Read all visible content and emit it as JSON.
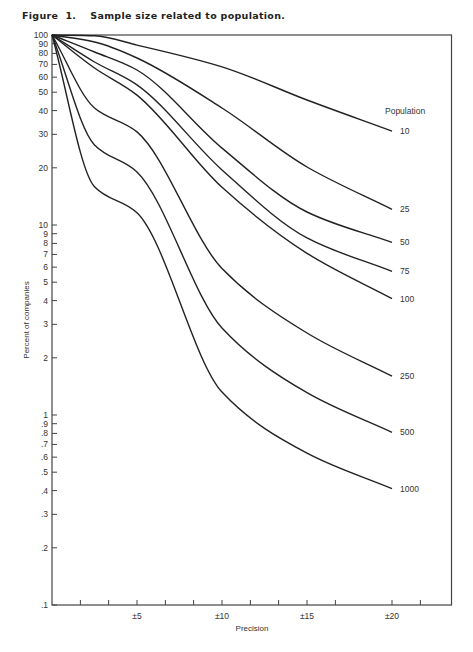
{
  "figure": {
    "number_label": "Figure  1.",
    "caption": "Sample size related to population."
  },
  "chart_data": {
    "type": "line",
    "xlabel": "Precision",
    "ylabel": "Percent of companies",
    "xlim": [
      0,
      23.5
    ],
    "ylim": [
      0.1,
      100
    ],
    "yscale": "log",
    "grid": false,
    "legend_title": "Population",
    "legend_position": "right, inline labels at curve ends",
    "x_ticks": [
      1.67,
      3.33,
      5,
      6.67,
      8.33,
      10,
      11.67,
      13.33,
      15,
      16.67,
      20,
      21.67
    ],
    "x_tick_labels": [
      {
        "value": 5,
        "label": "±5"
      },
      {
        "value": 10,
        "label": "±10"
      },
      {
        "value": 15,
        "label": "±15"
      },
      {
        "value": 20,
        "label": "±20"
      }
    ],
    "y_tick_labels": [
      {
        "value": 100,
        "label": "100"
      },
      {
        "value": 90,
        "label": "90"
      },
      {
        "value": 80,
        "label": "80"
      },
      {
        "value": 70,
        "label": "70"
      },
      {
        "value": 60,
        "label": "60"
      },
      {
        "value": 50,
        "label": "50"
      },
      {
        "value": 40,
        "label": "40"
      },
      {
        "value": 30,
        "label": "30"
      },
      {
        "value": 20,
        "label": "20"
      },
      {
        "value": 10,
        "label": "10"
      },
      {
        "value": 9,
        "label": "9"
      },
      {
        "value": 8,
        "label": "8"
      },
      {
        "value": 7,
        "label": "7"
      },
      {
        "value": 6,
        "label": "6"
      },
      {
        "value": 5,
        "label": "5"
      },
      {
        "value": 4,
        "label": "4"
      },
      {
        "value": 3,
        "label": "3"
      },
      {
        "value": 2,
        "label": "2"
      },
      {
        "value": 1,
        "label": "1"
      },
      {
        "value": 0.9,
        "label": ".9"
      },
      {
        "value": 0.8,
        "label": ".8"
      },
      {
        "value": 0.7,
        "label": ".7"
      },
      {
        "value": 0.6,
        "label": ".6"
      },
      {
        "value": 0.5,
        "label": ".5"
      },
      {
        "value": 0.4,
        "label": ".4"
      },
      {
        "value": 0.3,
        "label": ".3"
      },
      {
        "value": 0.2,
        "label": ".2"
      },
      {
        "value": 0.1,
        "label": ".1"
      }
    ],
    "x": [
      0,
      2.5,
      5,
      10,
      15,
      20
    ],
    "series": [
      {
        "name": "10",
        "values": [
          100,
          99,
          88.5,
          68,
          45.5,
          31.2
        ]
      },
      {
        "name": "25",
        "values": [
          100,
          91.9,
          75.7,
          41.3,
          20.2,
          12.1
        ]
      },
      {
        "name": "50",
        "values": [
          100,
          81.4,
          65.4,
          25.4,
          11.7,
          8.1
        ]
      },
      {
        "name": "75",
        "values": [
          100,
          72.1,
          54.6,
          19.5,
          8.55,
          5.7
        ]
      },
      {
        "name": "100",
        "values": [
          100,
          67,
          48.3,
          15.8,
          7.1,
          4.1
        ]
      },
      {
        "name": "250",
        "values": [
          100,
          41.3,
          30.9,
          5.9,
          2.7,
          1.6
        ]
      },
      {
        "name": "500",
        "values": [
          100,
          26.4,
          19.0,
          2.87,
          1.31,
          0.81
        ]
      },
      {
        "name": "1000",
        "values": [
          100,
          15.9,
          11.6,
          1.32,
          0.63,
          0.41
        ]
      }
    ]
  },
  "style": {
    "line_color": "#222222",
    "axis_color": "#444444",
    "background": "#ffffff"
  }
}
